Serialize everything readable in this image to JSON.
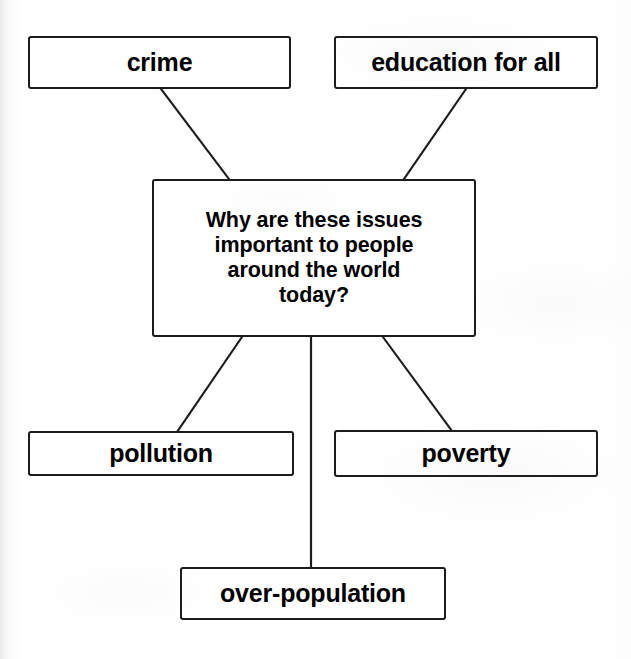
{
  "diagram": {
    "type": "concept-map",
    "title": "Why are these issues important to people around the world today?",
    "central_node": {
      "id": "central",
      "label": "Why are these issues important to people around the world today?",
      "lines": [
        "Why are these issues",
        "important to people",
        "around the world",
        "today?"
      ]
    },
    "nodes": [
      {
        "id": "crime",
        "label": "crime"
      },
      {
        "id": "education",
        "label": "education for all"
      },
      {
        "id": "pollution",
        "label": "pollution"
      },
      {
        "id": "poverty",
        "label": "poverty"
      },
      {
        "id": "overpop",
        "label": "over-population"
      }
    ],
    "edges": [
      {
        "from": "crime",
        "to": "central"
      },
      {
        "from": "education",
        "to": "central"
      },
      {
        "from": "central",
        "to": "pollution"
      },
      {
        "from": "central",
        "to": "poverty"
      },
      {
        "from": "central",
        "to": "overpop"
      }
    ],
    "colors": {
      "stroke": "#1c1c1c",
      "fill": "#ffffff",
      "text": "#000000",
      "background": "#ffffff"
    }
  }
}
